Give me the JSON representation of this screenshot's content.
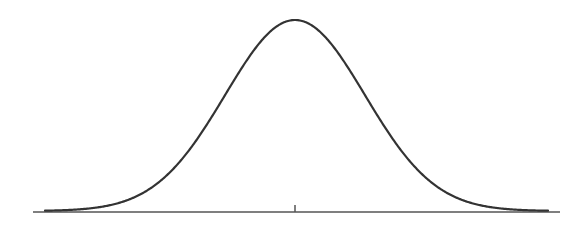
{
  "figure": {
    "type": "normal-distribution-curve",
    "colors": {
      "curve": "#333333",
      "axis": "#555555",
      "background": "#ffffff"
    },
    "axis": {
      "x_start": 33,
      "x_end": 560,
      "y": 212
    },
    "tick": {
      "x": 295,
      "y_top": 205,
      "y_bottom": 212
    },
    "curve": {
      "mean_x": 295,
      "sigma_px": 70,
      "peak_y": 20,
      "baseline_y": 211,
      "x_start": 45,
      "x_end": 548
    }
  }
}
